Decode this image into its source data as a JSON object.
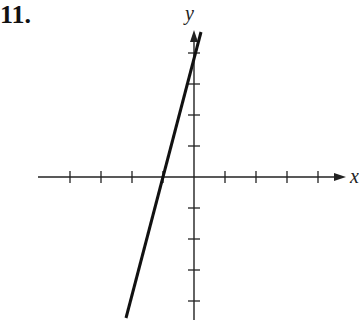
{
  "problem": {
    "number": "11."
  },
  "axes": {
    "x_label": "x",
    "y_label": "y",
    "origin_px": [
      194,
      177
    ],
    "unit_px": 31,
    "x_ticks": [
      -4,
      -3,
      -2,
      -1,
      1,
      2,
      3,
      4
    ],
    "y_ticks": [
      -4,
      -3,
      -2,
      -1,
      1,
      2,
      3,
      4
    ]
  },
  "line": {
    "description": "steep line with positive slope through (-1, 0) and (0, 4)",
    "points": [
      [
        -1,
        0
      ],
      [
        0,
        4
      ]
    ],
    "color": "#111111"
  }
}
